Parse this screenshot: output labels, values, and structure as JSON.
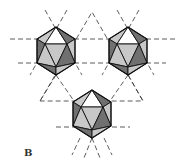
{
  "figure": {
    "panel_label": "B",
    "colors": {
      "light_face": "#c8c8c8",
      "dark_face": "#707070",
      "white_face": "#ffffff",
      "edge": "#111111",
      "dash": "#333333"
    },
    "icosahedra": [
      {
        "id": "left",
        "cx": 56,
        "cy": 51
      },
      {
        "id": "right",
        "cx": 128,
        "cy": 51
      },
      {
        "id": "bottom",
        "cx": 92,
        "cy": 114
      }
    ]
  }
}
